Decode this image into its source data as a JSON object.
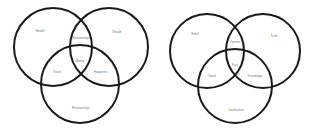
{
  "diagrams": [
    {
      "circles": [
        {
          "cx": 53,
          "cy": 47,
          "r": 39
        },
        {
          "cx": 109,
          "cy": 47,
          "r": 39
        },
        {
          "cx": 80,
          "cy": 84,
          "r": 39
        }
      ],
      "labels": {
        "top_left": "Health",
        "top_right": "Wealth",
        "top_overlap": "Relationships",
        "center": "Money",
        "left_overlap": "Travel",
        "right_overlap": "Happiness",
        "bottom": "Relationships"
      }
    },
    {
      "circles": [
        {
          "cx": 50,
          "cy": 51,
          "r": 37
        },
        {
          "cx": 106,
          "cy": 51,
          "r": 37
        },
        {
          "cx": 78,
          "cy": 86,
          "r": 37
        }
      ],
      "labels": {
        "top_left": "Belief",
        "top_right": "Truth",
        "top_overlap": "Opinion",
        "center": "Fact",
        "left_overlap": "Good",
        "right_overlap": "Knowledge",
        "bottom": "Justification"
      }
    }
  ],
  "style": {
    "stroke": "#1a1a1a",
    "stroke_width": 2,
    "label_color": "#777777"
  }
}
